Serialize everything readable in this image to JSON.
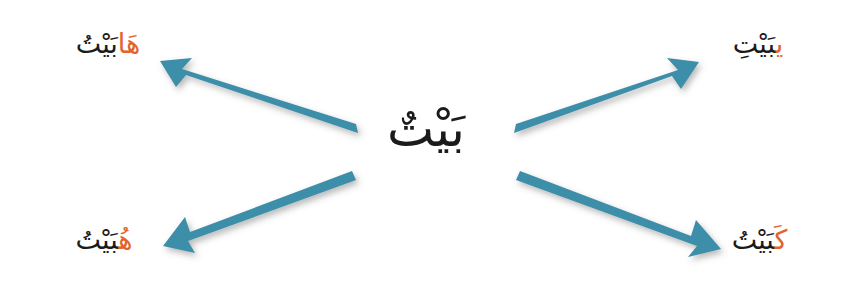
{
  "diagram": {
    "background_color": "#ffffff",
    "arrow_color": "#3d8ea8",
    "base_text_color": "#1b1b1b",
    "suffix_color": "#e2642b"
  },
  "center": {
    "stem": "بَيْتٌ",
    "transliteration": "baytun"
  },
  "branches": [
    {
      "position": "top-left",
      "stem": "بَيْتُ",
      "suffix": "هَا",
      "full": "بَيْتُهَا",
      "transliteration": "baytuhā",
      "arrow": {
        "from": [
          355,
          128
        ],
        "to": [
          158,
          62
        ],
        "direction": "up-left"
      }
    },
    {
      "position": "top-right",
      "stem": "بَيْتِ",
      "suffix": "ي",
      "full": "بَيْتِي",
      "transliteration": "baytī",
      "arrow": {
        "from": [
          517,
          128
        ],
        "to": [
          700,
          62
        ],
        "direction": "up-right"
      }
    },
    {
      "position": "bottom-left",
      "stem": "بَيْتُ",
      "suffix": "هُ",
      "full": "بَيْتُهُ",
      "transliteration": "baytuhu",
      "arrow": {
        "from": [
          355,
          175
        ],
        "to": [
          165,
          245
        ],
        "direction": "down-left"
      }
    },
    {
      "position": "bottom-right",
      "stem": "بَيْتُ",
      "suffix": "كَ",
      "full": "بَيْتُكَ",
      "transliteration": "baytuka",
      "arrow": {
        "from": [
          517,
          175
        ],
        "to": [
          720,
          250
        ],
        "direction": "down-right"
      }
    }
  ]
}
